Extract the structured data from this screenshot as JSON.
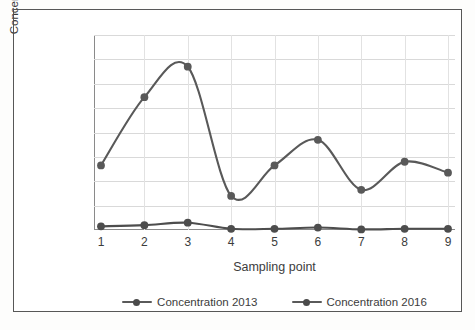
{
  "chart_data": {
    "type": "line",
    "title": "",
    "xlabel": "Sampling point",
    "ylabel": "Concentratio (cmol·kg-1)",
    "categories": [
      "1",
      "2",
      "3",
      "4",
      "5",
      "6",
      "7",
      "8",
      "9"
    ],
    "x": [
      1,
      2,
      3,
      4,
      5,
      6,
      7,
      8,
      9
    ],
    "xlim": [
      1,
      9
    ],
    "ylim": [
      0,
      0.16
    ],
    "yticks": [
      0,
      0.02,
      0.04,
      0.06,
      0.08,
      0.1,
      0.12,
      0.14,
      0.16
    ],
    "ytick_labels": [
      "0",
      "0.02",
      "0.04",
      "0.06",
      "0.08",
      "0.1",
      "0.12",
      "0.14",
      "0.16"
    ],
    "grid": true,
    "smoothing": "spline",
    "legend_position": "bottom",
    "series": [
      {
        "name": "Concentration 2013",
        "color": "#595959",
        "marker": "circle",
        "values": [
          0.053,
          0.109,
          0.134,
          0.028,
          0.053,
          0.074,
          0.033,
          0.056,
          0.047
        ]
      },
      {
        "name": "Concentration 2016",
        "color": "#4d4d4d",
        "marker": "circle",
        "values": [
          0.003,
          0.004,
          0.006,
          0.001,
          0.001,
          0.002,
          0.0005,
          0.001,
          0.001
        ]
      }
    ]
  },
  "legend": {
    "items": [
      {
        "label": "Concentration 2013"
      },
      {
        "label": "Concentration 2016"
      }
    ]
  },
  "colors": {
    "series_2013": "#595959",
    "series_2016": "#4d4d4d",
    "grid": "#d9d9d9",
    "axis": "#8a8a8a",
    "text": "#3c3c3c",
    "frame": "#4d4d4d"
  }
}
